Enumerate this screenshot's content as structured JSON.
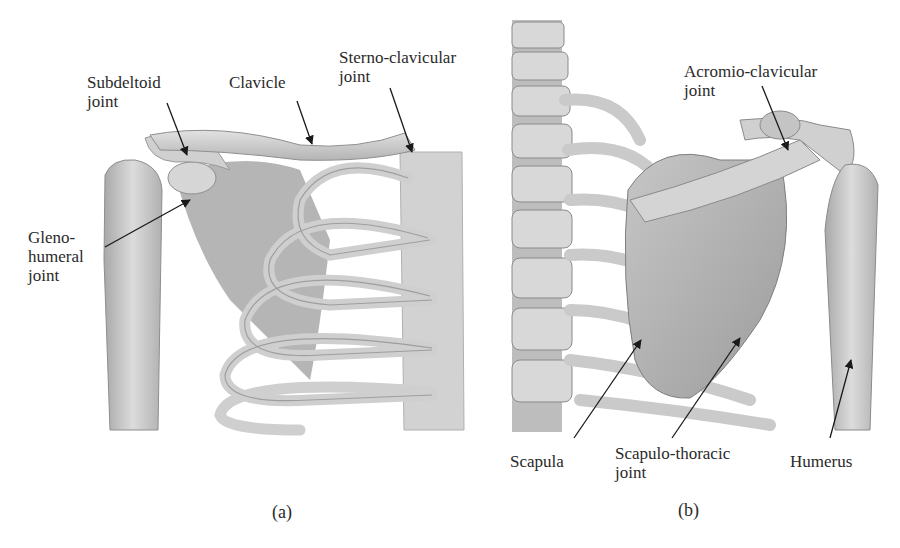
{
  "figure": {
    "panels": [
      {
        "id": "a",
        "caption": "(a)",
        "view": "anterior",
        "labels": {
          "subdeltoid": "Subdeltoid\njoint",
          "clavicle": "Clavicle",
          "sterno": "Sterno-clavicular\njoint",
          "gleno": "Gleno-\nhumeral\njoint"
        }
      },
      {
        "id": "b",
        "caption": "(b)",
        "view": "posterior",
        "labels": {
          "acromio": "Acromio-clavicular\njoint",
          "scapula": "Scapula",
          "scapulothoracic": "Scapulo-thoracic\njoint",
          "humerus": "Humerus"
        }
      }
    ]
  },
  "colors": {
    "bone": "#c9c9c9",
    "bone_light": "#dedede",
    "bone_dark": "#9a9a9a",
    "shadow": "#8a8a8a",
    "arrow": "#1a1a1a",
    "background": "#ffffff"
  }
}
